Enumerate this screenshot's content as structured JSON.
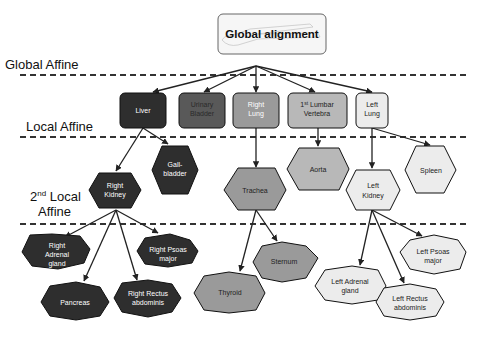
{
  "top_node": {
    "label": "Global alignment",
    "fill": "#f6f6f6",
    "stroke": "#666666"
  },
  "stages": [
    {
      "label": "Global Affine"
    },
    {
      "label": "Local Affine"
    },
    {
      "label_main": "2",
      "label_sup": "nd",
      "label_rest": " Local",
      "label_line2": "Affine"
    }
  ],
  "level1": [
    {
      "id": "liver",
      "lines": [
        "Liver"
      ],
      "fill": "#2e2e2e",
      "text_color": "#ffffff"
    },
    {
      "id": "urinary-bladder",
      "lines": [
        "Urinary",
        "Bladder"
      ],
      "fill": "#595959",
      "text_color": "#222222"
    },
    {
      "id": "right-lung",
      "lines": [
        "Right",
        "Lung"
      ],
      "fill": "#9a9a9a",
      "text_color": "#ffffff"
    },
    {
      "id": "lumbar-vertebra",
      "lines_sup": {
        "pre": "1",
        "sup": "st",
        "post": " Lumbar"
      },
      "lines": [
        "1st Lumbar",
        "Vertebra"
      ],
      "fill": "#b8b8b8",
      "text_color": "#222222"
    },
    {
      "id": "left-lung",
      "lines": [
        "Left",
        "Lung"
      ],
      "fill": "#ececec",
      "text_color": "#222222"
    }
  ],
  "level2": [
    {
      "id": "gallbladder",
      "lines": [
        "Gall-",
        "bladder"
      ],
      "fill": "#2e2e2e",
      "text_color": "#ffffff"
    },
    {
      "id": "right-kidney",
      "lines": [
        "Right",
        "Kidney"
      ],
      "fill": "#2e2e2e",
      "text_color": "#ffffff"
    },
    {
      "id": "trachea",
      "lines": [
        "Trachea"
      ],
      "fill": "#9a9a9a",
      "text_color": "#222222"
    },
    {
      "id": "aorta",
      "lines": [
        "Aorta"
      ],
      "fill": "#b8b8b8",
      "text_color": "#222222"
    },
    {
      "id": "left-kidney",
      "lines": [
        "Left",
        "Kidney"
      ],
      "fill": "#ececec",
      "text_color": "#222222"
    },
    {
      "id": "spleen",
      "lines": [
        "Spleen"
      ],
      "fill": "#ececec",
      "text_color": "#222222"
    }
  ],
  "level3": [
    {
      "id": "right-adrenal-gland",
      "lines": [
        "Right",
        "Adrenal",
        "gland"
      ],
      "fill": "#2e2e2e",
      "text_color": "#ffffff"
    },
    {
      "id": "right-psoas-major",
      "lines": [
        "Right Psoas",
        "major"
      ],
      "fill": "#2e2e2e",
      "text_color": "#ffffff"
    },
    {
      "id": "pancreas",
      "lines": [
        "Pancreas"
      ],
      "fill": "#2e2e2e",
      "text_color": "#ffffff"
    },
    {
      "id": "right-rectus-abdominis",
      "lines": [
        "Right Rectus",
        "abdominis"
      ],
      "fill": "#2e2e2e",
      "text_color": "#ffffff"
    },
    {
      "id": "sternum",
      "lines": [
        "Sternum"
      ],
      "fill": "#9a9a9a",
      "text_color": "#222222"
    },
    {
      "id": "thyroid",
      "lines": [
        "Thyroid"
      ],
      "fill": "#9a9a9a",
      "text_color": "#222222"
    },
    {
      "id": "left-psoas-major",
      "lines": [
        "Left Psoas",
        "major"
      ],
      "fill": "#ececec",
      "text_color": "#222222"
    },
    {
      "id": "left-adrenal-gland",
      "lines": [
        "Left Adrenal",
        "gland"
      ],
      "fill": "#ececec",
      "text_color": "#222222"
    },
    {
      "id": "left-rectus-abdominis",
      "lines": [
        "Left Rectus",
        "abdominis"
      ],
      "fill": "#ececec",
      "text_color": "#222222"
    }
  ]
}
